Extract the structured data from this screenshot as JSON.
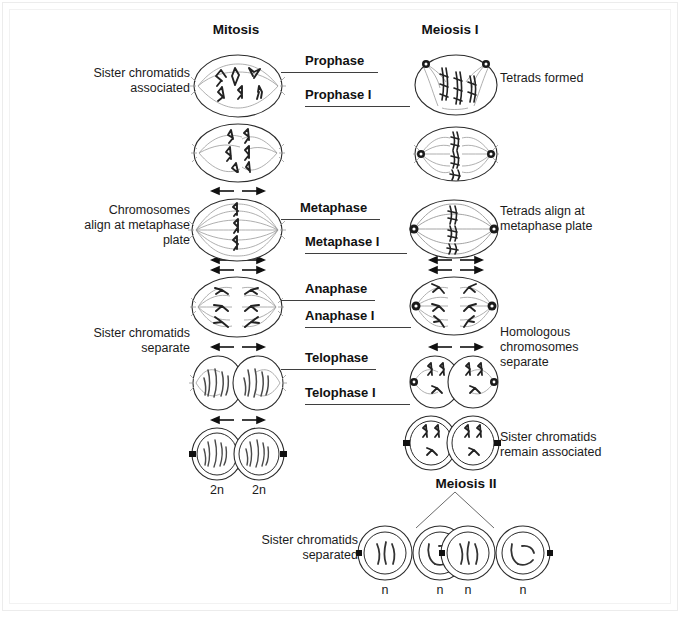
{
  "diagram": {
    "title_mitosis": "Mitosis",
    "title_meiosis_i": "Meiosis I",
    "title_meiosis_ii": "Meiosis II"
  },
  "phases": {
    "prophase": "Prophase",
    "prophase_i": "Prophase I",
    "metaphase": "Metaphase",
    "metaphase_i": "Metaphase I",
    "anaphase": "Anaphase",
    "anaphase_i": "Anaphase I",
    "telophase": "Telophase",
    "telophase_i": "Telophase I"
  },
  "left_labels": {
    "prophase_note": "Sister chromatids\nassociated",
    "metaphase_note": "Chromosomes\nalign at metaphase\nplate",
    "anaphase_note": "Sister chromatids\nseparate"
  },
  "right_labels": {
    "prophase_note": "Tetrads formed",
    "metaphase_note": "Tetrads align at\nmetaphase plate",
    "anaphase_note": "Homologous\nchromosomes\nseparate",
    "telophase_note": "Sister chromatids\nremain associated",
    "meiosis_ii_note": "Sister chromatids\nseparated"
  },
  "ploidy": {
    "mitosis_left": "2n",
    "mitosis_right": "2n",
    "gamete_1": "n",
    "gamete_2": "n",
    "gamete_3": "n",
    "gamete_4": "n"
  },
  "colors": {
    "ink": "#1a1a1a",
    "cell_outline": "#2b2b2b",
    "spindle": "#8a8a8a",
    "chromosome": "#222222",
    "rule": "#3f3f3f",
    "frame": "#ececec",
    "background": "#ffffff"
  },
  "icons": {
    "centrosome": "centrosome-icon",
    "arrow_pair": "separation-arrows-icon",
    "cell": "cell-outline-icon",
    "chromosome": "chromosome-icon",
    "branch": "meiosis-ii-branch-icon"
  }
}
